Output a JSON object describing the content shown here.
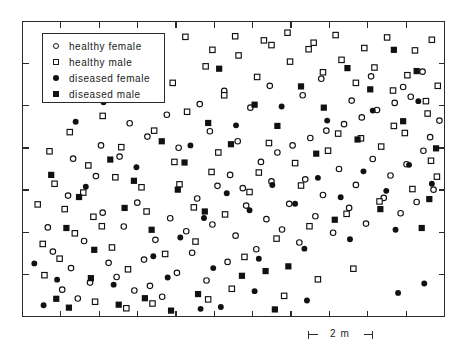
{
  "figure": {
    "background_color": "#ffffff",
    "frame_color": "#2a2a2a",
    "marker_color": "#111111"
  },
  "legend": {
    "entries": [
      {
        "label": "healthy female",
        "marker": "open-circle"
      },
      {
        "label": "healthy male",
        "marker": "open-square"
      },
      {
        "label": "diseased female",
        "marker": "filled-circle"
      },
      {
        "label": "diseased male",
        "marker": "filled-square"
      }
    ]
  },
  "scalebar": {
    "label": "2 m",
    "length_m": 2
  },
  "chart_data": {
    "type": "scatter",
    "title": "",
    "xlabel": "",
    "ylabel": "",
    "xlim": [
      0,
      100
    ],
    "ylim": [
      0,
      100
    ],
    "grid": false,
    "legend_position": "top-left",
    "axis": {
      "frame": true,
      "ticks_inward": true,
      "tick_labels": false,
      "x_tick_count": 11,
      "y_tick_count": 7
    },
    "series": [
      {
        "name": "healthy female",
        "marker": "open-circle",
        "points": [
          [
            9.4,
            9.1
          ],
          [
            13.1,
            6.1
          ],
          [
            16.0,
            11.5
          ],
          [
            20.4,
            18.2
          ],
          [
            11.5,
            16.4
          ],
          [
            7.2,
            22.0
          ],
          [
            14.6,
            25.6
          ],
          [
            26.5,
            8.8
          ],
          [
            22.3,
            13.4
          ],
          [
            30.2,
            10.4
          ],
          [
            33.1,
            6.7
          ],
          [
            28.8,
            19.3
          ],
          [
            36.6,
            14.8
          ],
          [
            24.0,
            30.5
          ],
          [
            19.0,
            35.2
          ],
          [
            31.5,
            26.0
          ],
          [
            27.2,
            38.6
          ],
          [
            35.0,
            33.3
          ],
          [
            40.2,
            21.6
          ],
          [
            43.6,
            12.2
          ],
          [
            38.8,
            28.9
          ],
          [
            45.0,
            31.2
          ],
          [
            48.6,
            18.5
          ],
          [
            41.4,
            40.0
          ],
          [
            46.2,
            44.3
          ],
          [
            50.5,
            27.4
          ],
          [
            53.0,
            37.6
          ],
          [
            49.2,
            48.0
          ],
          [
            55.4,
            22.8
          ],
          [
            57.8,
            33.0
          ],
          [
            52.2,
            43.5
          ],
          [
            59.0,
            45.8
          ],
          [
            61.5,
            29.5
          ],
          [
            56.5,
            52.4
          ],
          [
            63.2,
            38.2
          ],
          [
            65.6,
            25.1
          ],
          [
            60.4,
            55.6
          ],
          [
            67.0,
            46.5
          ],
          [
            69.4,
            34.0
          ],
          [
            64.0,
            58.0
          ],
          [
            71.2,
            41.2
          ],
          [
            73.6,
            28.4
          ],
          [
            68.2,
            60.5
          ],
          [
            75.0,
            50.0
          ],
          [
            77.4,
            36.8
          ],
          [
            72.0,
            63.0
          ],
          [
            79.0,
            44.6
          ],
          [
            81.4,
            31.5
          ],
          [
            76.2,
            65.2
          ],
          [
            83.0,
            53.4
          ],
          [
            85.6,
            40.2
          ],
          [
            80.4,
            67.5
          ],
          [
            87.2,
            47.8
          ],
          [
            89.6,
            35.0
          ],
          [
            84.0,
            70.0
          ],
          [
            91.0,
            51.6
          ],
          [
            93.4,
            38.8
          ],
          [
            88.2,
            72.4
          ],
          [
            95.0,
            56.2
          ],
          [
            97.4,
            43.0
          ],
          [
            92.0,
            74.5
          ],
          [
            96.6,
            60.8
          ],
          [
            98.8,
            66.4
          ],
          [
            6.0,
            30.2
          ],
          [
            10.8,
            41.0
          ],
          [
            17.4,
            47.6
          ],
          [
            23.0,
            54.2
          ],
          [
            29.6,
            61.0
          ],
          [
            34.2,
            68.4
          ],
          [
            42.0,
            72.0
          ],
          [
            47.8,
            76.5
          ],
          [
            54.0,
            70.8
          ],
          [
            58.6,
            78.2
          ],
          [
            66.4,
            75.0
          ],
          [
            70.8,
            80.6
          ],
          [
            78.0,
            73.2
          ],
          [
            82.6,
            81.4
          ],
          [
            90.2,
            77.8
          ],
          [
            94.8,
            83.0
          ],
          [
            12.0,
            53.5
          ],
          [
            18.6,
            58.0
          ],
          [
            25.4,
            65.5
          ],
          [
            37.0,
            57.2
          ],
          [
            44.4,
            62.8
          ],
          [
            51.0,
            59.4
          ]
        ]
      },
      {
        "name": "healthy male",
        "marker": "open-square",
        "points": [
          [
            5.2,
            14.0
          ],
          [
            8.8,
            19.6
          ],
          [
            12.4,
            28.2
          ],
          [
            16.8,
            33.8
          ],
          [
            21.2,
            23.4
          ],
          [
            25.0,
            16.0
          ],
          [
            29.4,
            35.6
          ],
          [
            33.8,
            21.2
          ],
          [
            37.2,
            44.8
          ],
          [
            41.0,
            25.4
          ],
          [
            44.8,
            49.0
          ],
          [
            48.0,
            34.6
          ],
          [
            52.6,
            20.2
          ],
          [
            56.0,
            48.8
          ],
          [
            60.2,
            26.4
          ],
          [
            64.6,
            52.0
          ],
          [
            68.0,
            30.6
          ],
          [
            72.4,
            56.2
          ],
          [
            76.8,
            34.8
          ],
          [
            80.2,
            60.4
          ],
          [
            84.6,
            39.0
          ],
          [
            88.0,
            64.6
          ],
          [
            92.4,
            43.2
          ],
          [
            96.0,
            68.8
          ],
          [
            98.2,
            47.4
          ],
          [
            7.6,
            45.0
          ],
          [
            11.2,
            62.5
          ],
          [
            15.6,
            51.2
          ],
          [
            19.0,
            68.0
          ],
          [
            23.4,
            57.4
          ],
          [
            27.8,
            73.6
          ],
          [
            31.2,
            63.0
          ],
          [
            35.6,
            79.2
          ],
          [
            39.0,
            69.4
          ],
          [
            43.4,
            84.8
          ],
          [
            47.8,
            75.0
          ],
          [
            51.2,
            88.5
          ],
          [
            55.6,
            81.2
          ],
          [
            59.0,
            92.0
          ],
          [
            63.4,
            86.4
          ],
          [
            67.8,
            90.6
          ],
          [
            71.2,
            82.8
          ],
          [
            75.6,
            87.0
          ],
          [
            79.0,
            79.2
          ],
          [
            83.4,
            84.4
          ],
          [
            87.8,
            76.6
          ],
          [
            91.2,
            81.8
          ],
          [
            95.6,
            73.0
          ],
          [
            98.4,
            78.2
          ],
          [
            6.4,
            56.0
          ],
          [
            13.8,
            73.5
          ],
          [
            20.0,
            80.0
          ],
          [
            26.2,
            86.6
          ],
          [
            32.4,
            91.2
          ],
          [
            38.6,
            94.8
          ],
          [
            45.0,
            90.4
          ],
          [
            50.4,
            95.0
          ],
          [
            57.2,
            93.6
          ],
          [
            62.8,
            96.2
          ],
          [
            69.0,
            92.8
          ],
          [
            74.2,
            95.4
          ],
          [
            81.0,
            91.0
          ],
          [
            86.4,
            94.6
          ],
          [
            93.0,
            90.2
          ],
          [
            97.0,
            93.8
          ],
          [
            10.0,
            36.4
          ],
          [
            14.4,
            42.0
          ],
          [
            18.8,
            30.6
          ],
          [
            22.0,
            47.2
          ],
          [
            28.2,
            43.8
          ],
          [
            36.0,
            52.4
          ],
          [
            40.6,
            37.0
          ],
          [
            46.4,
            55.6
          ],
          [
            53.8,
            42.2
          ],
          [
            58.4,
            58.8
          ],
          [
            66.0,
            44.4
          ],
          [
            74.8,
            62.0
          ],
          [
            85.0,
            57.6
          ],
          [
            90.6,
            62.2
          ],
          [
            96.8,
            52.8
          ],
          [
            3.6,
            38.0
          ],
          [
            4.8,
            24.6
          ],
          [
            44.0,
            5.8
          ],
          [
            49.6,
            9.4
          ],
          [
            62.0,
            7.0
          ],
          [
            24.6,
            2.8
          ],
          [
            30.8,
            4.4
          ],
          [
            17.2,
            5.0
          ],
          [
            70.0,
            12.6
          ],
          [
            78.4,
            16.2
          ]
        ]
      },
      {
        "name": "diseased female",
        "marker": "filled-circle",
        "points": [
          [
            8.2,
            12.5
          ],
          [
            15.0,
            44.0
          ],
          [
            21.6,
            10.8
          ],
          [
            27.0,
            50.6
          ],
          [
            34.4,
            13.2
          ],
          [
            39.8,
            58.0
          ],
          [
            45.2,
            16.4
          ],
          [
            50.6,
            64.8
          ],
          [
            56.0,
            19.6
          ],
          [
            61.4,
            71.2
          ],
          [
            66.8,
            23.0
          ],
          [
            72.2,
            66.4
          ],
          [
            77.6,
            26.2
          ],
          [
            83.0,
            69.8
          ],
          [
            88.4,
            29.4
          ],
          [
            93.8,
            73.0
          ],
          [
            12.6,
            66.0
          ],
          [
            19.2,
            72.6
          ],
          [
            25.8,
            79.0
          ],
          [
            43.0,
            33.4
          ],
          [
            48.4,
            41.8
          ],
          [
            53.8,
            36.0
          ],
          [
            59.2,
            44.6
          ],
          [
            64.6,
            38.2
          ],
          [
            70.0,
            47.0
          ],
          [
            75.4,
            40.4
          ],
          [
            80.8,
            49.2
          ],
          [
            86.2,
            42.6
          ],
          [
            91.6,
            51.4
          ],
          [
            97.0,
            45.0
          ],
          [
            37.4,
            26.8
          ],
          [
            31.0,
            20.4
          ],
          [
            42.2,
            2.6
          ],
          [
            47.0,
            3.2
          ],
          [
            5.0,
            3.8
          ],
          [
            2.8,
            18.0
          ],
          [
            89.0,
            8.0
          ],
          [
            95.2,
            11.2
          ],
          [
            55.0,
            8.6
          ],
          [
            67.4,
            5.4
          ]
        ]
      },
      {
        "name": "diseased male",
        "marker": "filled-square",
        "points": [
          [
            6.8,
            48.0
          ],
          [
            13.4,
            40.5
          ],
          [
            20.8,
            53.2
          ],
          [
            26.4,
            46.0
          ],
          [
            33.0,
            59.4
          ],
          [
            38.4,
            52.2
          ],
          [
            44.0,
            65.6
          ],
          [
            49.4,
            58.4
          ],
          [
            55.0,
            71.8
          ],
          [
            60.4,
            64.6
          ],
          [
            66.0,
            78.0
          ],
          [
            71.4,
            70.8
          ],
          [
            77.0,
            84.2
          ],
          [
            82.4,
            77.0
          ],
          [
            88.0,
            90.4
          ],
          [
            93.4,
            83.2
          ],
          [
            10.4,
            30.0
          ],
          [
            17.0,
            22.6
          ],
          [
            24.2,
            36.8
          ],
          [
            30.6,
            29.4
          ],
          [
            36.8,
            43.0
          ],
          [
            43.2,
            35.6
          ],
          [
            52.0,
            13.8
          ],
          [
            57.6,
            15.4
          ],
          [
            63.0,
            17.0
          ],
          [
            69.6,
            55.2
          ],
          [
            74.0,
            32.8
          ],
          [
            79.4,
            60.0
          ],
          [
            84.8,
            36.4
          ],
          [
            90.2,
            66.2
          ],
          [
            96.4,
            39.8
          ],
          [
            46.6,
            84.0
          ],
          [
            29.0,
            6.2
          ],
          [
            35.2,
            2.0
          ],
          [
            41.6,
            7.6
          ],
          [
            16.2,
            13.0
          ],
          [
            22.8,
            4.0
          ],
          [
            94.6,
            30.0
          ],
          [
            98.0,
            57.0
          ],
          [
            59.8,
            2.4
          ],
          [
            8.0,
            6.0
          ],
          [
            11.0,
            3.0
          ]
        ]
      }
    ]
  }
}
